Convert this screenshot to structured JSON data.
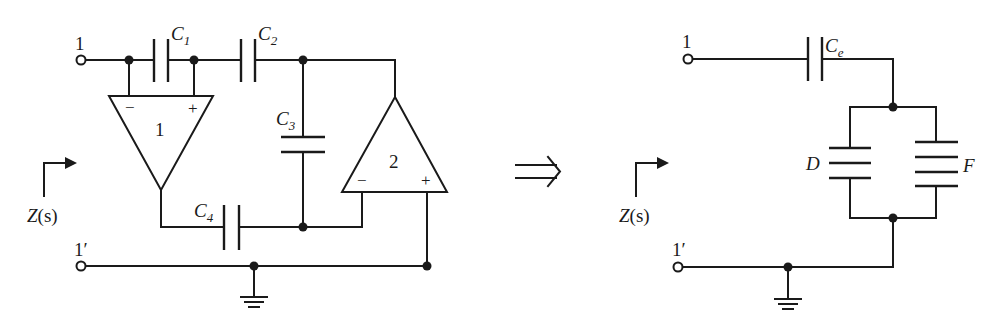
{
  "left_circuit": {
    "terminals": {
      "top": "1",
      "bottom": "1′"
    },
    "impedance_label": {
      "main": "Z",
      "arg": "(s)"
    },
    "capacitors": {
      "c1": {
        "letter": "C",
        "sub": "1"
      },
      "c2": {
        "letter": "C",
        "sub": "2"
      },
      "c3": {
        "letter": "C",
        "sub": "3"
      },
      "c4": {
        "letter": "C",
        "sub": "4"
      }
    },
    "opamps": {
      "a1": {
        "label": "1",
        "minus": "−",
        "plus": "+"
      },
      "a2": {
        "label": "2",
        "minus": "−",
        "plus": "+"
      }
    }
  },
  "implies_symbol": "⇒",
  "right_circuit": {
    "terminals": {
      "top": "1",
      "bottom": "1′"
    },
    "impedance_label": {
      "main": "Z",
      "arg": "(s)"
    },
    "capacitor_ce": {
      "letter": "C",
      "sub": "e"
    },
    "element_d": "D",
    "element_f": "F"
  }
}
